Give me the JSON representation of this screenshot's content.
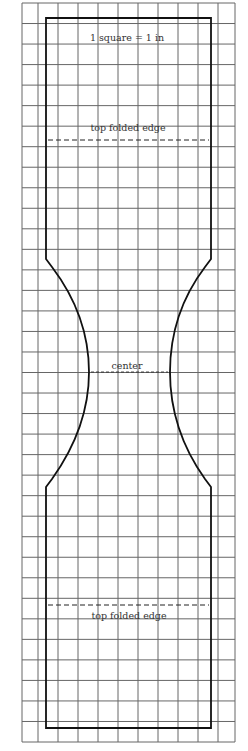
{
  "diagram": {
    "type": "sewing-pattern",
    "scale_label": "1 square = 1 in",
    "labels": {
      "top_fold": "top folded edge",
      "center": "center",
      "bottom_fold": "top folded edge"
    },
    "grid": {
      "columns_x": [
        22,
        38,
        58,
        78,
        98,
        118,
        138,
        158,
        178,
        198,
        218,
        235
      ],
      "rows": 36,
      "top": 3,
      "bottom": 742,
      "color": "#555555"
    },
    "outline_color": "#111111"
  }
}
